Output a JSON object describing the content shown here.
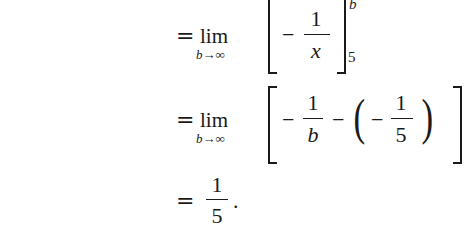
{
  "math": {
    "line1": {
      "equals": "=",
      "lim": "lim",
      "lim_sub": "b→∞",
      "minus": "−",
      "frac": {
        "num": "1",
        "den": "x"
      },
      "eval_upper": "b",
      "eval_lower": "5"
    },
    "line2": {
      "equals": "=",
      "lim": "lim",
      "lim_sub": "b→∞",
      "minus1": "−",
      "frac1": {
        "num": "1",
        "den": "b"
      },
      "minus2": "−",
      "paren_open": "(",
      "minus3": "−",
      "frac2": {
        "num": "1",
        "den": "5"
      },
      "paren_close": ")"
    },
    "line3": {
      "equals": "=",
      "frac": {
        "num": "1",
        "den": "5"
      },
      "period": "."
    }
  }
}
